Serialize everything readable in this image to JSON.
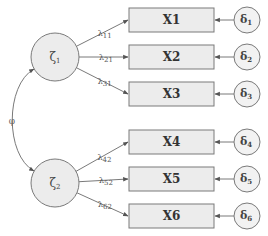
{
  "diagram": {
    "type": "confirmatory-factor-analysis",
    "latent_factors": [
      {
        "id": "zeta1",
        "symbol": "ζ",
        "subscript": "1"
      },
      {
        "id": "zeta2",
        "symbol": "ζ",
        "subscript": "2"
      }
    ],
    "factor_covariance": {
      "symbol": "φ",
      "between": [
        "zeta1",
        "zeta2"
      ]
    },
    "indicators": [
      {
        "label": "X1",
        "factor": "zeta1",
        "loading": {
          "symbol": "λ",
          "subscript": "11"
        },
        "error": {
          "symbol": "δ",
          "subscript": "1"
        }
      },
      {
        "label": "X2",
        "factor": "zeta1",
        "loading": {
          "symbol": "λ",
          "subscript": "21"
        },
        "error": {
          "symbol": "δ",
          "subscript": "2"
        }
      },
      {
        "label": "X3",
        "factor": "zeta1",
        "loading": {
          "symbol": "λ",
          "subscript": "31"
        },
        "error": {
          "symbol": "δ",
          "subscript": "3"
        }
      },
      {
        "label": "X4",
        "factor": "zeta2",
        "loading": {
          "symbol": "λ",
          "subscript": "42"
        },
        "error": {
          "symbol": "δ",
          "subscript": "4"
        }
      },
      {
        "label": "X5",
        "factor": "zeta2",
        "loading": {
          "symbol": "λ",
          "subscript": "52"
        },
        "error": {
          "symbol": "δ",
          "subscript": "5"
        }
      },
      {
        "label": "X6",
        "factor": "zeta2",
        "loading": {
          "symbol": "λ",
          "subscript": "62"
        },
        "error": {
          "symbol": "δ",
          "subscript": "6"
        }
      }
    ],
    "colors": {
      "node_fill": "#ececec",
      "stroke": "#7a7a7a",
      "text": "#333333"
    }
  }
}
